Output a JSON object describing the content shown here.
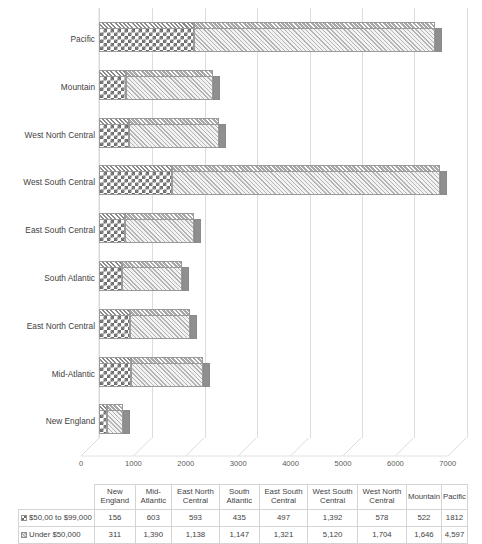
{
  "chart_data": {
    "type": "bar",
    "orientation": "horizontal",
    "stacked": true,
    "three_d": true,
    "title": "",
    "xlabel": "",
    "ylabel": "",
    "xlim": [
      0,
      7000
    ],
    "xticks": [
      0,
      1000,
      2000,
      3000,
      4000,
      5000,
      6000,
      7000
    ],
    "xticklabels": [
      "0",
      "1000",
      "2000",
      "3000",
      "4000",
      "5000",
      "6000",
      "7000"
    ],
    "grid": true,
    "legend_position": "table",
    "categories": [
      "New England",
      "Mid-Atlantic",
      "East North Central",
      "South Atlantic",
      "East South Central",
      "West South Central",
      "West North Central",
      "Mountain",
      "Pacific"
    ],
    "categories_axis_order_top_to_bottom": [
      "Pacific",
      "Mountain",
      "West North Central",
      "West South Central",
      "East South Central",
      "South Atlantic",
      "East North Central",
      "Mid-Atlantic",
      "New England"
    ],
    "series": [
      {
        "name": "$50,00 to $99,000",
        "values": [
          156,
          603,
          593,
          435,
          497,
          1392,
          578,
          522,
          1812
        ]
      },
      {
        "name": "Under $50,000",
        "values": [
          311,
          1390,
          1138,
          1147,
          1321,
          5120,
          1704,
          1646,
          4597
        ]
      }
    ]
  },
  "table": {
    "corner_label": "",
    "columns": [
      "New England",
      "Mid-Atlantic",
      "East North Central",
      "South Atlantic",
      "East South Central",
      "West South Central",
      "West North Central",
      "Mountain",
      "Pacific"
    ],
    "rows": [
      {
        "label": "$50,00 to $99,000",
        "key": "checkerboard-swatch",
        "values": [
          "156",
          "603",
          "593",
          "435",
          "497",
          "1,392",
          "578",
          "522",
          "1812"
        ]
      },
      {
        "label": "Under $50,000",
        "key": "hatch-swatch",
        "values": [
          "311",
          "1,390",
          "1,138",
          "1,147",
          "1,321",
          "5,120",
          "1,704",
          "1,646",
          "4,597"
        ]
      }
    ]
  },
  "colors": {
    "series1_fill": "#6e6e6e",
    "series2_fill": "#b4b4b4",
    "gridline": "#dcdcdc",
    "text": "#3f3f3f",
    "table_border": "#d4d4d4"
  }
}
